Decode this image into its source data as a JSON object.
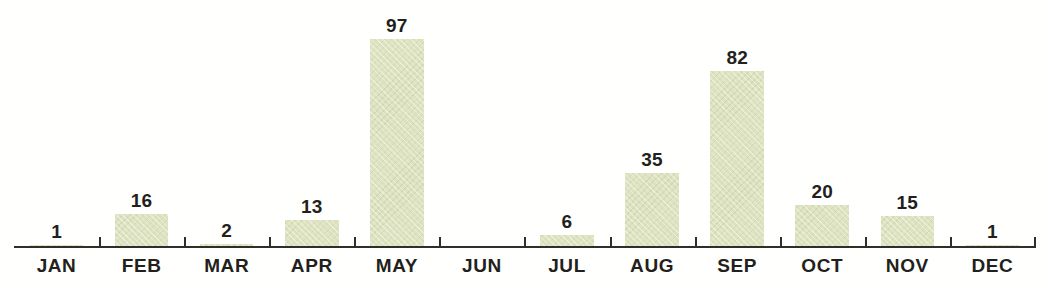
{
  "chart_data": {
    "type": "bar",
    "title": "",
    "subtitle": "",
    "xlabel": "",
    "ylabel": "",
    "grid": false,
    "legend": false,
    "ylim": [
      0,
      97
    ],
    "axis_line": true,
    "tick_marks": true,
    "bar_color": "#dde3c0",
    "text_color": "#231f1c",
    "axis_color": "#2e2e2a",
    "background_color": "#fffffd",
    "categories": [
      "JAN",
      "FEB",
      "MAR",
      "APR",
      "MAY",
      "JUN",
      "JUL",
      "AUG",
      "SEP",
      "OCT",
      "NOV",
      "DEC"
    ],
    "values": [
      1,
      16,
      2,
      13,
      97,
      0,
      6,
      35,
      82,
      20,
      15,
      1
    ],
    "data_labels": [
      "1",
      "16",
      "2",
      "13",
      "97",
      "",
      "6",
      "35",
      "82",
      "20",
      "15",
      "1"
    ],
    "points": [
      {
        "category": "JAN",
        "value": 1,
        "label": "1"
      },
      {
        "category": "FEB",
        "value": 16,
        "label": "16"
      },
      {
        "category": "MAR",
        "value": 2,
        "label": "2"
      },
      {
        "category": "APR",
        "value": 13,
        "label": "13"
      },
      {
        "category": "MAY",
        "value": 97,
        "label": "97"
      },
      {
        "category": "JUN",
        "value": 0,
        "label": ""
      },
      {
        "category": "JUL",
        "value": 6,
        "label": "6"
      },
      {
        "category": "AUG",
        "value": 35,
        "label": "35"
      },
      {
        "category": "SEP",
        "value": 82,
        "label": "82"
      },
      {
        "category": "OCT",
        "value": 20,
        "label": "20"
      },
      {
        "category": "NOV",
        "value": 15,
        "label": "15"
      },
      {
        "category": "DEC",
        "value": 1,
        "label": "1"
      }
    ]
  }
}
